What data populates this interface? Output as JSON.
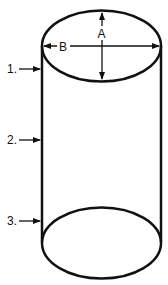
{
  "diagram": {
    "type": "cylinder",
    "dimensions": {
      "a_label": "A",
      "b_label": "B"
    },
    "callouts": [
      {
        "label": "1."
      },
      {
        "label": "2."
      },
      {
        "label": "3."
      }
    ],
    "colors": {
      "stroke": "#111111",
      "background": "#ffffff"
    }
  }
}
